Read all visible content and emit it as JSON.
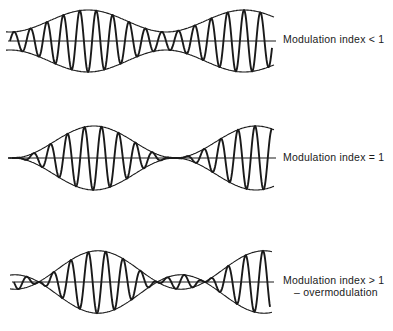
{
  "diagram": {
    "stroke_color": "#1a1a1a",
    "panels": [
      {
        "id": "under",
        "label": "Modulation index < 1",
        "sublabel": "",
        "axis_y": 41,
        "x_start": 10,
        "x_end": 272,
        "carrier_amplitude": 20,
        "modulation_index": 0.55,
        "envelope_period": 156,
        "envelope_phase_x": 88,
        "carrier_cycles_per_envelope": 9.5,
        "label_x": 283,
        "label_y": 33
      },
      {
        "id": "critical",
        "label": "Modulation index = 1",
        "sublabel": "",
        "axis_y": 158,
        "x_start": 12,
        "x_end": 272,
        "carrier_amplitude": 16,
        "modulation_index": 1.0,
        "envelope_period": 162,
        "envelope_phase_x": 94,
        "carrier_cycles_per_envelope": 9.5,
        "label_x": 283,
        "label_y": 151
      },
      {
        "id": "over",
        "label": "Modulation index > 1",
        "sublabel": "– overmodulation",
        "axis_y": 282,
        "x_start": 14,
        "x_end": 270,
        "carrier_amplitude": 12,
        "modulation_index": 1.6,
        "envelope_period": 166,
        "envelope_phase_x": 98,
        "carrier_cycles_per_envelope": 9.5,
        "label_x": 283,
        "label_y": 274
      }
    ]
  }
}
